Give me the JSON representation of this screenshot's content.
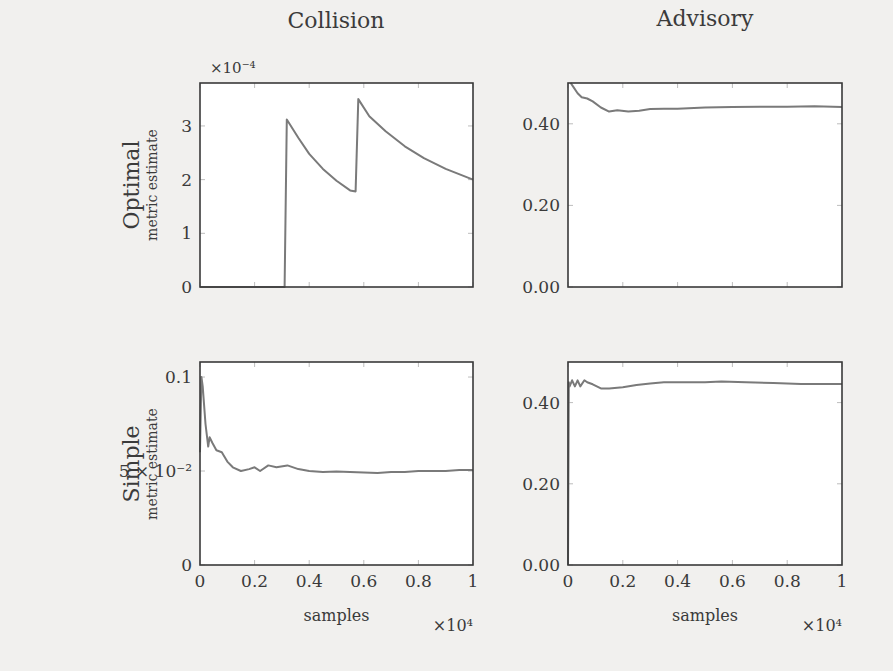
{
  "figure": {
    "column_titles": [
      "Collision",
      "Advisory"
    ],
    "row_labels": [
      {
        "title": "Optimal",
        "subtitle": "metric estimate"
      },
      {
        "title": "Simple",
        "subtitle": "metric estimate"
      }
    ],
    "line_color": "#7a7a7a",
    "axis_color": "#3a3a3a",
    "plot_bg": "#ffffff"
  },
  "chart_data": [
    {
      "id": "optimal-collision",
      "type": "line",
      "title": "Collision",
      "row": "Optimal",
      "xlabel": "",
      "ylabel": "metric estimate",
      "y_multiplier_label": "×10⁻⁴",
      "xlim": [
        0,
        10000
      ],
      "ylim": [
        0,
        3.8
      ],
      "yticks": [
        0,
        1,
        2,
        3
      ],
      "ytick_labels": [
        "0",
        "1",
        "2",
        "3"
      ],
      "xticks": [
        0,
        2000,
        4000,
        6000,
        8000,
        10000
      ],
      "xtick_labels": [],
      "series": [
        {
          "name": "estimate (×10⁻⁴)",
          "x": [
            0,
            3100,
            3180,
            3600,
            4000,
            4500,
            5000,
            5500,
            5700,
            5800,
            6200,
            6800,
            7500,
            8200,
            9000,
            10000
          ],
          "y": [
            0,
            0,
            3.12,
            2.78,
            2.48,
            2.2,
            1.98,
            1.8,
            1.78,
            3.5,
            3.18,
            2.9,
            2.62,
            2.4,
            2.2,
            2.0
          ]
        }
      ]
    },
    {
      "id": "optimal-advisory",
      "type": "line",
      "title": "Advisory",
      "row": "Optimal",
      "xlabel": "",
      "ylabel": "",
      "xlim": [
        0,
        10000
      ],
      "ylim": [
        0,
        0.5
      ],
      "yticks": [
        0.0,
        0.2,
        0.4
      ],
      "ytick_labels": [
        "0.00",
        "0.20",
        "0.40"
      ],
      "xticks": [
        0,
        2000,
        4000,
        6000,
        8000,
        10000
      ],
      "xtick_labels": [],
      "series": [
        {
          "name": "estimate",
          "x": [
            100,
            200,
            350,
            500,
            700,
            900,
            1200,
            1500,
            1800,
            2200,
            2600,
            3000,
            3500,
            4000,
            5000,
            6000,
            7000,
            8000,
            9000,
            10000
          ],
          "y": [
            0.5,
            0.49,
            0.475,
            0.465,
            0.462,
            0.455,
            0.44,
            0.43,
            0.433,
            0.43,
            0.432,
            0.436,
            0.437,
            0.437,
            0.44,
            0.441,
            0.442,
            0.442,
            0.443,
            0.441
          ]
        }
      ]
    },
    {
      "id": "simple-collision",
      "type": "line",
      "title": "Collision",
      "row": "Simple",
      "xlabel": "samples",
      "ylabel": "metric estimate",
      "x_multiplier_label": "×10⁴",
      "xlim": [
        0,
        10000
      ],
      "ylim": [
        0,
        0.108
      ],
      "yticks": [
        0,
        0.05,
        0.1
      ],
      "ytick_labels": [
        "0",
        "5 × 10⁻²",
        "0.1"
      ],
      "xticks": [
        0,
        2000,
        4000,
        6000,
        8000,
        10000
      ],
      "xtick_labels": [
        "0",
        "0.2",
        "0.4",
        "0.6",
        "0.8",
        "1"
      ],
      "series": [
        {
          "name": "estimate",
          "x": [
            0,
            50,
            100,
            200,
            300,
            350,
            450,
            600,
            800,
            1000,
            1200,
            1500,
            1800,
            2000,
            2200,
            2500,
            2800,
            3200,
            3600,
            4000,
            4500,
            5000,
            5500,
            6000,
            6500,
            7000,
            7500,
            8000,
            8500,
            9000,
            9500,
            10000
          ],
          "y": [
            0.06,
            0.1,
            0.095,
            0.075,
            0.063,
            0.068,
            0.065,
            0.061,
            0.06,
            0.055,
            0.052,
            0.05,
            0.051,
            0.052,
            0.05,
            0.053,
            0.052,
            0.053,
            0.051,
            0.05,
            0.0495,
            0.0498,
            0.0495,
            0.0492,
            0.049,
            0.0495,
            0.0495,
            0.05,
            0.05,
            0.05,
            0.0505,
            0.0505
          ]
        }
      ]
    },
    {
      "id": "simple-advisory",
      "type": "line",
      "title": "Advisory",
      "row": "Simple",
      "xlabel": "samples",
      "ylabel": "",
      "x_multiplier_label": "×10⁴",
      "xlim": [
        0,
        10000
      ],
      "ylim": [
        0,
        0.5
      ],
      "yticks": [
        0.0,
        0.2,
        0.4
      ],
      "ytick_labels": [
        "0.00",
        "0.20",
        "0.40"
      ],
      "xticks": [
        0,
        2000,
        4000,
        6000,
        8000,
        10000
      ],
      "xtick_labels": [
        "0",
        "0.2",
        "0.4",
        "0.6",
        "0.8",
        "1"
      ],
      "series": [
        {
          "name": "estimate",
          "x": [
            0,
            30,
            60,
            150,
            250,
            350,
            450,
            600,
            700,
            900,
            1200,
            1500,
            2000,
            2500,
            3000,
            3500,
            4000,
            5000,
            5600,
            6500,
            7500,
            8500,
            9000,
            10000
          ],
          "y": [
            0.0,
            0.45,
            0.44,
            0.455,
            0.44,
            0.455,
            0.44,
            0.455,
            0.45,
            0.445,
            0.435,
            0.435,
            0.438,
            0.443,
            0.447,
            0.45,
            0.45,
            0.45,
            0.452,
            0.45,
            0.448,
            0.446,
            0.446,
            0.446
          ]
        }
      ]
    }
  ]
}
